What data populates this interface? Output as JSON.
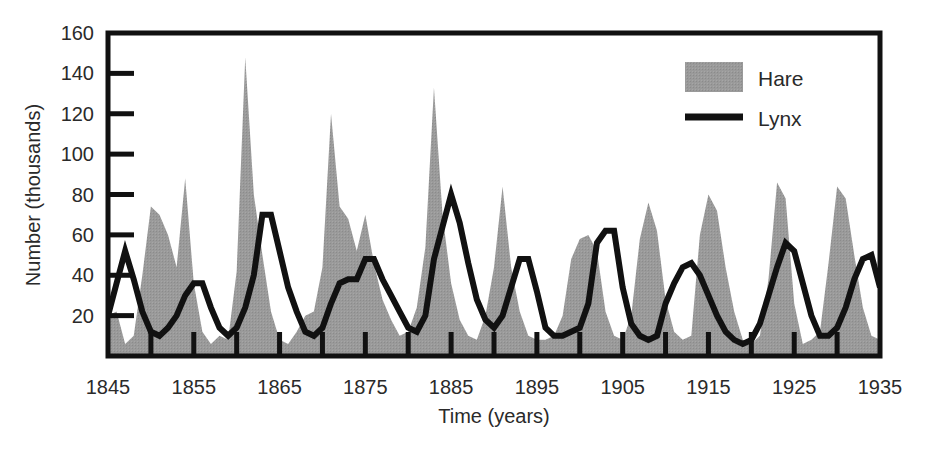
{
  "chart_data": {
    "type": "area",
    "title": "",
    "xlabel": "Time (years)",
    "ylabel": "Number (thousands)",
    "xlim": [
      1845,
      1935
    ],
    "ylim": [
      0,
      160
    ],
    "xticks": [
      1845,
      1855,
      1865,
      1875,
      1885,
      1895,
      1905,
      1915,
      1925,
      1935
    ],
    "xtick_labels": [
      "1845",
      "1855",
      "1865",
      "1875",
      "1885",
      "1895",
      "1905",
      "1915",
      "1925",
      "1935"
    ],
    "yticks": [
      20,
      40,
      60,
      80,
      100,
      120,
      140,
      160
    ],
    "ytick_labels": [
      "20",
      "40",
      "60",
      "80",
      "100",
      "120",
      "140",
      "160"
    ],
    "minor_xtick_step": 5,
    "grid": false,
    "legend_position": "top-right",
    "colors": {
      "hare_fill": "#999999",
      "lynx_line": "#111111",
      "axis": "#111111",
      "text": "#2a2a2a",
      "background": "#ffffff"
    },
    "x": [
      1845,
      1846,
      1847,
      1848,
      1849,
      1850,
      1851,
      1852,
      1853,
      1854,
      1855,
      1856,
      1857,
      1858,
      1859,
      1860,
      1861,
      1862,
      1863,
      1864,
      1865,
      1866,
      1867,
      1868,
      1869,
      1870,
      1871,
      1872,
      1873,
      1874,
      1875,
      1876,
      1877,
      1878,
      1879,
      1880,
      1881,
      1882,
      1883,
      1884,
      1885,
      1886,
      1887,
      1888,
      1889,
      1890,
      1891,
      1892,
      1893,
      1894,
      1895,
      1896,
      1897,
      1898,
      1899,
      1900,
      1901,
      1902,
      1903,
      1904,
      1905,
      1906,
      1907,
      1908,
      1909,
      1910,
      1911,
      1912,
      1913,
      1914,
      1915,
      1916,
      1917,
      1918,
      1919,
      1920,
      1921,
      1922,
      1923,
      1924,
      1925,
      1926,
      1927,
      1928,
      1929,
      1930,
      1931,
      1932,
      1933,
      1934,
      1935
    ],
    "series": [
      {
        "name": "Hare",
        "type": "area",
        "fill": "#999999",
        "values": [
          20,
          22,
          6,
          10,
          40,
          74,
          70,
          60,
          44,
          88,
          36,
          12,
          6,
          10,
          8,
          42,
          148,
          80,
          50,
          22,
          8,
          6,
          12,
          20,
          22,
          44,
          120,
          74,
          68,
          52,
          70,
          46,
          28,
          18,
          10,
          12,
          24,
          54,
          133,
          70,
          36,
          18,
          10,
          8,
          20,
          44,
          84,
          44,
          22,
          10,
          8,
          8,
          10,
          20,
          48,
          58,
          60,
          52,
          22,
          10,
          8,
          20,
          58,
          76,
          62,
          28,
          12,
          8,
          10,
          60,
          80,
          72,
          44,
          22,
          8,
          6,
          10,
          38,
          86,
          78,
          26,
          6,
          8,
          12,
          46,
          84,
          78,
          50,
          24,
          10,
          8
        ],
        "peaks": [
          {
            "year": 1861,
            "value": 148
          },
          {
            "year": 1883,
            "value": 133
          },
          {
            "year": 1871,
            "value": 120
          },
          {
            "year": 1854,
            "value": 88
          },
          {
            "year": 1929,
            "value": 86
          },
          {
            "year": 1891,
            "value": 84
          },
          {
            "year": 1919,
            "value": 80
          }
        ]
      },
      {
        "name": "Lynx",
        "type": "line",
        "color": "#111111",
        "values": [
          20,
          36,
          52,
          38,
          22,
          12,
          10,
          14,
          20,
          30,
          36,
          36,
          24,
          14,
          10,
          14,
          24,
          40,
          70,
          70,
          52,
          34,
          22,
          12,
          10,
          14,
          26,
          36,
          38,
          38,
          48,
          48,
          38,
          30,
          22,
          14,
          12,
          20,
          48,
          64,
          80,
          66,
          46,
          28,
          18,
          14,
          20,
          34,
          48,
          48,
          32,
          14,
          10,
          10,
          12,
          14,
          26,
          56,
          62,
          62,
          34,
          16,
          10,
          8,
          10,
          26,
          36,
          44,
          46,
          40,
          30,
          20,
          12,
          8,
          6,
          8,
          16,
          30,
          44,
          56,
          52,
          36,
          20,
          10,
          10,
          14,
          24,
          38,
          48,
          50,
          34
        ],
        "peaks": [
          {
            "year": 1885,
            "value": 80
          },
          {
            "year": 1863,
            "value": 70
          },
          {
            "year": 1864,
            "value": 70
          },
          {
            "year": 1886,
            "value": 66
          },
          {
            "year": 1903,
            "value": 62
          },
          {
            "year": 1924,
            "value": 56
          },
          {
            "year": 1902,
            "value": 56
          }
        ]
      }
    ],
    "legend": [
      {
        "label": "Hare",
        "marker": "filled-square",
        "color": "#999999"
      },
      {
        "label": "Lynx",
        "marker": "line",
        "color": "#111111"
      }
    ]
  }
}
